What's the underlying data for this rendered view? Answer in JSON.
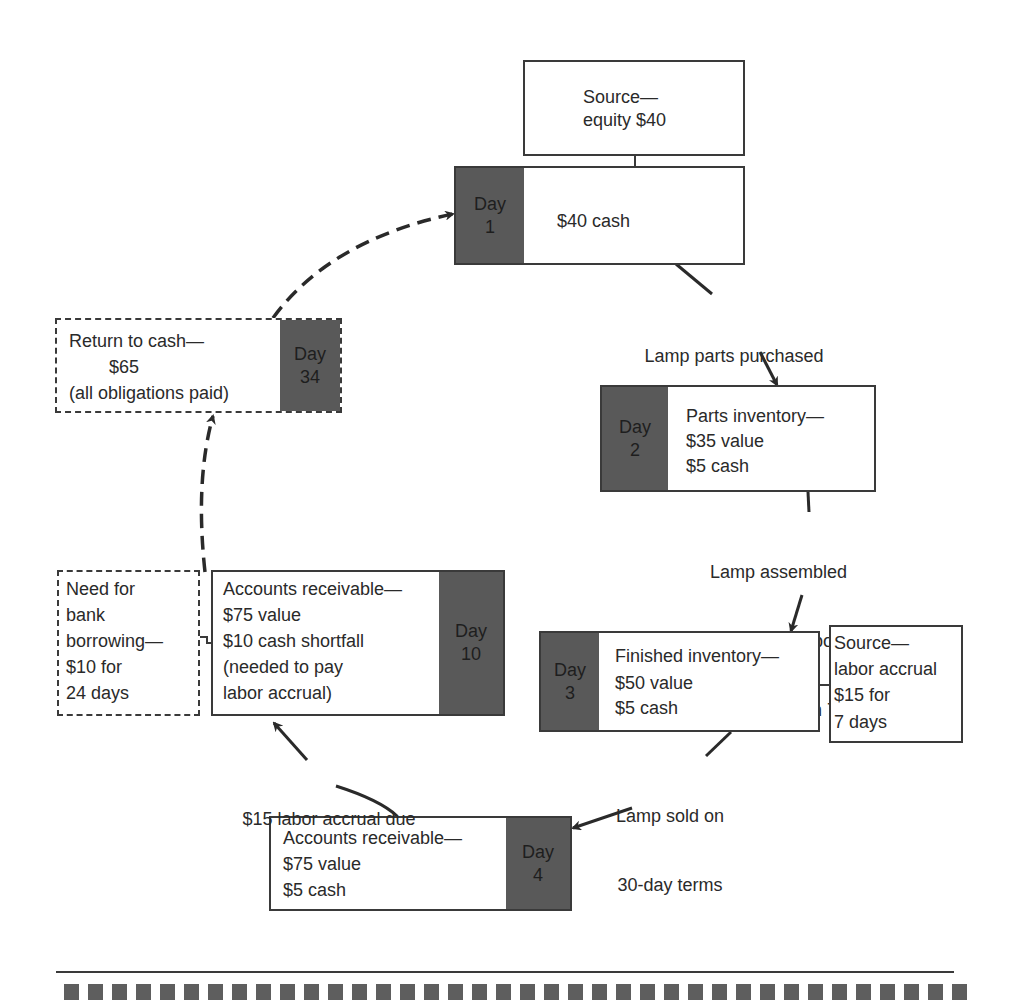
{
  "diagram": {
    "type": "cash-cycle-flow",
    "nodes": {
      "source_equity": {
        "lines": [
          "Source—",
          "equity $40"
        ]
      },
      "day1": {
        "day_label": "Day",
        "day_number": "1",
        "lines": [
          "$40 cash"
        ]
      },
      "day2": {
        "day_label": "Day",
        "day_number": "2",
        "lines": [
          "Parts inventory—",
          "$35 value",
          "$5 cash"
        ]
      },
      "day3": {
        "day_label": "Day",
        "day_number": "3",
        "lines": [
          "Finished inventory—",
          "$50 value",
          "$5 cash"
        ]
      },
      "source_labor": {
        "lines": [
          "Source—",
          "labor accrual",
          "$15 for",
          "7 days"
        ]
      },
      "day4": {
        "day_label": "Day",
        "day_number": "4",
        "lines": [
          "Accounts receivable—",
          "$75 value",
          "$5 cash"
        ]
      },
      "day10": {
        "day_label": "Day",
        "day_number": "10",
        "lines": [
          "Accounts receivable—",
          "$75 value",
          "$10 cash shortfall",
          "(needed to pay",
          "labor accrual)"
        ]
      },
      "bank_borrowing": {
        "lines": [
          "Need for",
          "bank",
          "borrowing—",
          "$10 for",
          "24 days"
        ]
      },
      "day34": {
        "day_label": "Day",
        "day_number": "34",
        "lines": [
          "Return to cash—",
          "        $65",
          "(all obligations paid)"
        ]
      }
    },
    "edges": {
      "day1_to_day2": {
        "label": [
          "Lamp parts purchased",
          "for $35"
        ]
      },
      "day2_to_day3": {
        "label": [
          "Lamp assembled",
          "($15 in labor costs",
          "payable in 7 days)"
        ]
      },
      "day3_to_day4": {
        "label": [
          "Lamp sold on",
          "30-day terms"
        ]
      },
      "day4_to_day10": {
        "label": [
          "$15 labor accrual due"
        ]
      },
      "day10_to_day34": {
        "label": [],
        "style": "dashed"
      },
      "day34_to_day1": {
        "label": [],
        "style": "dashed"
      }
    },
    "colors": {
      "day_fill": "#595959",
      "border": "#3a3a3a",
      "text": "#2a2a2a"
    },
    "footer": {
      "square_count": 38
    }
  }
}
